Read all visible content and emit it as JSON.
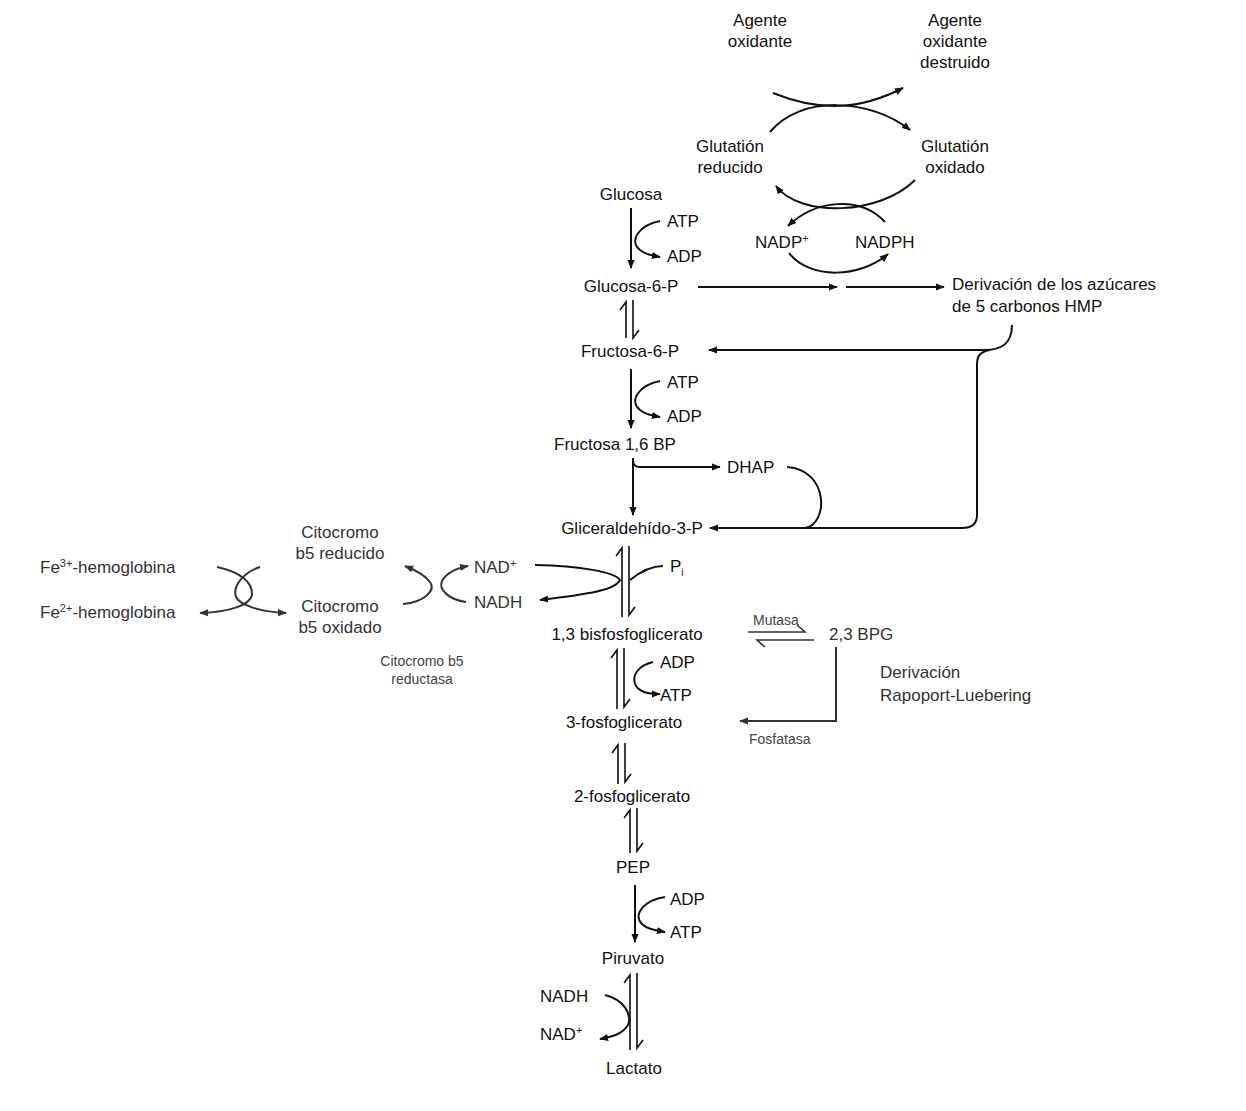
{
  "diagram": {
    "glutathione_cycle": {
      "oxidizing_agent": "Agente\noxidante",
      "oxidizing_agent_destroyed": "Agente\noxidante\ndestruido",
      "reduced_glutathione": "Glutatión\nreducido",
      "oxidized_glutathione": "Glutatión\noxidado",
      "nadp_plus": "NADP",
      "nadp_plus_sup": "+",
      "nadph": "NADPH"
    },
    "main_pathway": {
      "glucose": "Glucosa",
      "atp_1": "ATP",
      "adp_1": "ADP",
      "glucose_6p": "Glucosa-6-P",
      "fructose_6p": "Fructosa-6-P",
      "atp_2": "ATP",
      "adp_2": "ADP",
      "fructose_16bp": "Fructosa 1,6 BP",
      "dhap": "DHAP",
      "glyceraldehyde_3p": "Gliceraldehído-3-P",
      "pi": "P",
      "pi_sub": "i",
      "bpg_13": "1,3 bisfosfoglicerato",
      "adp_3": "ADP",
      "atp_3": "ATP",
      "pg_3": "3-fosfoglicerato",
      "pg_2": "2-fosfoglicerato",
      "pep": "PEP",
      "adp_4": "ADP",
      "atp_4": "ATP",
      "pyruvate": "Piruvato",
      "nadh_lactate": "NADH",
      "nad_lactate": "NAD",
      "nad_lactate_sup": "+",
      "lactate": "Lactato"
    },
    "hmp_shunt": {
      "label": "Derivación de los azúcares\nde 5 carbonos HMP"
    },
    "methemoglobin_reduction": {
      "fe3_prefix": "Fe",
      "fe3_sup": "3+",
      "fe3_suffix": "-hemoglobina",
      "fe2_prefix": "Fe",
      "fe2_sup": "2+",
      "fe2_suffix": "-hemoglobina",
      "cyt_b5_reduced": "Citocromo\nb5 reducido",
      "cyt_b5_oxidized": "Citocromo\nb5 oxidado",
      "nad_plus": "NAD",
      "nad_plus_sup": "+",
      "nadh": "NADH",
      "enzyme": "Citocromo b5\nreductasa"
    },
    "rapoport_luebering": {
      "mutase": "Mutasa",
      "bpg_23": "2,3 BPG",
      "shunt_label": "Derivación\nRapoport-Luebering",
      "phosphatase": "Fosfatasa"
    }
  }
}
